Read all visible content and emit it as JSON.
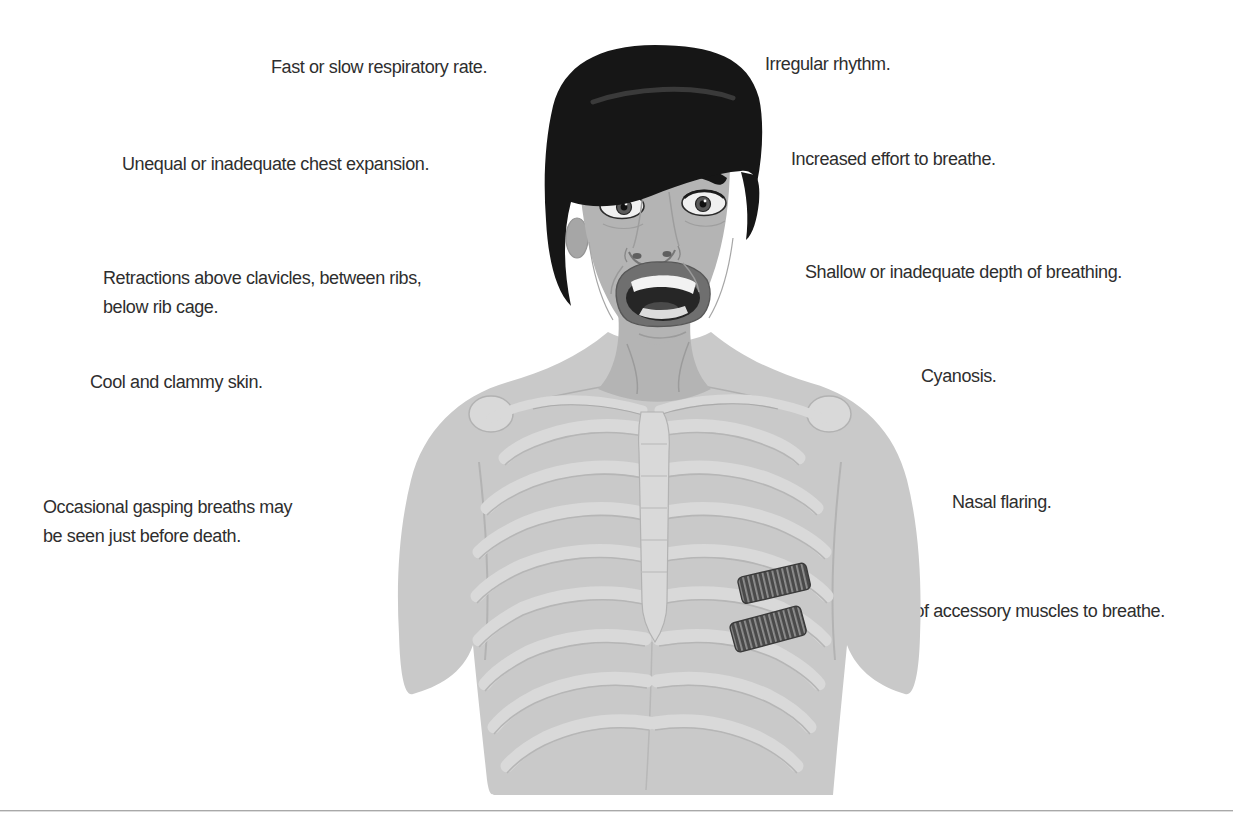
{
  "page": {
    "background": "#ffffff"
  },
  "figure": {
    "alt": "Man with distressed expression and open mouth; rib cage visible through chest; dark striated intercostal accessory muscles highlighted on lower left ribs",
    "skin_tone": "grayscale"
  },
  "labels": {
    "respiratory_rate": "Fast or slow respiratory rate.",
    "irregular_rhythm": "Irregular rhythm.",
    "chest_expansion": "Unequal or inadequate chest expansion.",
    "increased_effort": "Increased effort to breathe.",
    "retractions_line1": "Retractions above clavicles, between ribs,",
    "retractions_line2": "below rib cage.",
    "shallow_depth": "Shallow or inadequate depth of breathing.",
    "cool_clammy": "Cool and clammy skin.",
    "cyanosis": "Cyanosis.",
    "gasping_line1": "Occasional gasping breaths may",
    "gasping_line2": "be seen just before death.",
    "nasal_flaring": "Nasal flaring.",
    "accessory_muscles": "Use of accessory muscles to breathe."
  },
  "colors": {
    "label_text": "#2e2e2e",
    "body_gray": "#c9c9c9",
    "skin_gray": "#b4b4b4",
    "hair_black": "#161616",
    "bone_gray": "#d9d9d9",
    "muscle_band_dark": "#4a4a4a",
    "bottom_rule": "#a9a9a9"
  }
}
